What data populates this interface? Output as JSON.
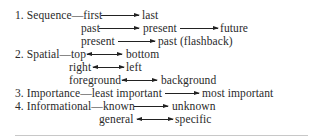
{
  "list": {
    "items": [
      {
        "number": "1.",
        "category": "Sequence",
        "lines": [
          {
            "from": "first",
            "arrow": "right",
            "to": "last"
          },
          {
            "from": "past",
            "arrow": "right",
            "to": "present",
            "arrow2": "right",
            "to2": "future"
          },
          {
            "from": "present",
            "arrow": "right",
            "to": "past (flashback)"
          }
        ]
      },
      {
        "number": "2.",
        "category": "Spatial",
        "lines": [
          {
            "from": "top",
            "arrow": "both",
            "to": "bottom"
          },
          {
            "from": "right",
            "arrow": "both",
            "to": "left"
          },
          {
            "from": "foreground",
            "arrow": "both",
            "to": "background"
          }
        ]
      },
      {
        "number": "3.",
        "category": "Importance",
        "lines": [
          {
            "from": "least important",
            "arrow": "right",
            "to": "most important"
          }
        ]
      },
      {
        "number": "4.",
        "category": "Informational",
        "lines": [
          {
            "from": "known",
            "arrow": "right",
            "to": "unknown"
          },
          {
            "from": "general",
            "arrow": "both",
            "to": "specific"
          }
        ]
      }
    ]
  },
  "labels": {
    "r1_lead": "1. Sequence—first",
    "r1_to": "last",
    "r2_from": "past",
    "r2_to": "present",
    "r2_to2": "future",
    "r3_from": "present",
    "r3_to": "past (flashback)",
    "r4_lead": "2. Spatial—top",
    "r4_to": "bottom",
    "r5_from": "right",
    "r5_to": "left",
    "r6_from": "foreground",
    "r6_to": "background",
    "r7_lead": "3. Importance—least important",
    "r7_to": "most important",
    "r8_lead": "4. Informational—known",
    "r8_to": "unknown",
    "r9_from": "general",
    "r9_to": "specific"
  }
}
